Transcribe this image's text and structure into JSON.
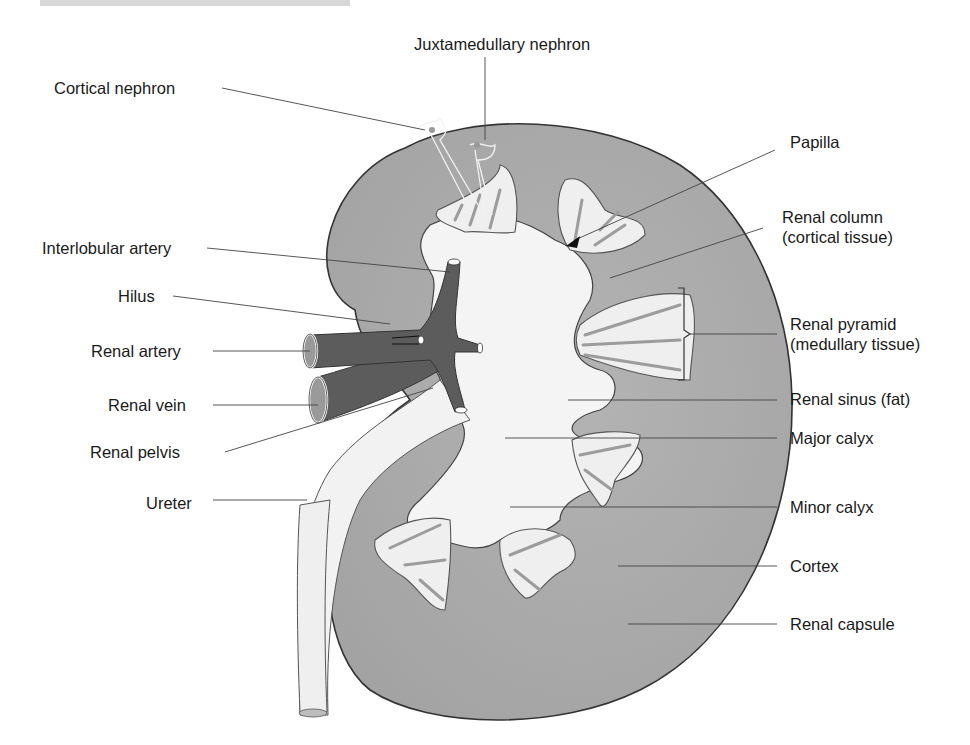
{
  "diagram": {
    "labels_left": [
      {
        "id": "cortical-nephron",
        "text": "Cortical nephron"
      },
      {
        "id": "interlobular-artery",
        "text": "Interlobular artery"
      },
      {
        "id": "hilus",
        "text": "Hilus"
      },
      {
        "id": "renal-artery",
        "text": "Renal artery"
      },
      {
        "id": "renal-vein",
        "text": "Renal vein"
      },
      {
        "id": "renal-pelvis",
        "text": "Renal pelvis"
      },
      {
        "id": "ureter",
        "text": "Ureter"
      }
    ],
    "labels_top": [
      {
        "id": "juxtamedullary-nephron",
        "text": "Juxtamedullary  nephron"
      }
    ],
    "labels_right": [
      {
        "id": "papilla",
        "text": "Papilla"
      },
      {
        "id": "renal-column",
        "line1": "Renal column",
        "line2": "(cortical tissue)"
      },
      {
        "id": "renal-pyramid",
        "line1": "Renal pyramid",
        "line2": "(medullary tissue)"
      },
      {
        "id": "renal-sinus",
        "text": "Renal sinus (fat)"
      },
      {
        "id": "major-calyx",
        "text": "Major calyx"
      },
      {
        "id": "minor-calyx",
        "text": "Minor calyx"
      },
      {
        "id": "cortex",
        "text": "Cortex"
      },
      {
        "id": "renal-capsule",
        "text": "Renal capsule"
      }
    ],
    "colors": {
      "cortex": "#a9a9a9",
      "pyramid": "#efefef",
      "pyramid_striation": "#9c9c9c",
      "vessels": "#5c5c5c",
      "sinus": "#f4f4f4",
      "outline": "#333333",
      "leader_line": "#444444"
    }
  }
}
